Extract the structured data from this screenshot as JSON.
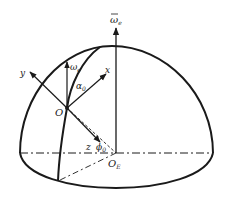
{
  "diagram": {
    "type": "hemisphere-coordinate-frame",
    "colors": {
      "stroke": "#1a1a1a",
      "background": "#ffffff"
    },
    "labels": {
      "earth_rate_global": "ω",
      "earth_rate_global_sub": "e",
      "earth_rate_local": "ω",
      "earth_rate_local_sub": "e",
      "axis_x": "x",
      "axis_y": "y",
      "axis_z": "z",
      "origin": "O",
      "earth_center": "O",
      "earth_center_sub": "E",
      "alpha": "α",
      "alpha_sub": "0",
      "phi": "ϕ",
      "phi_sub": "0"
    }
  }
}
